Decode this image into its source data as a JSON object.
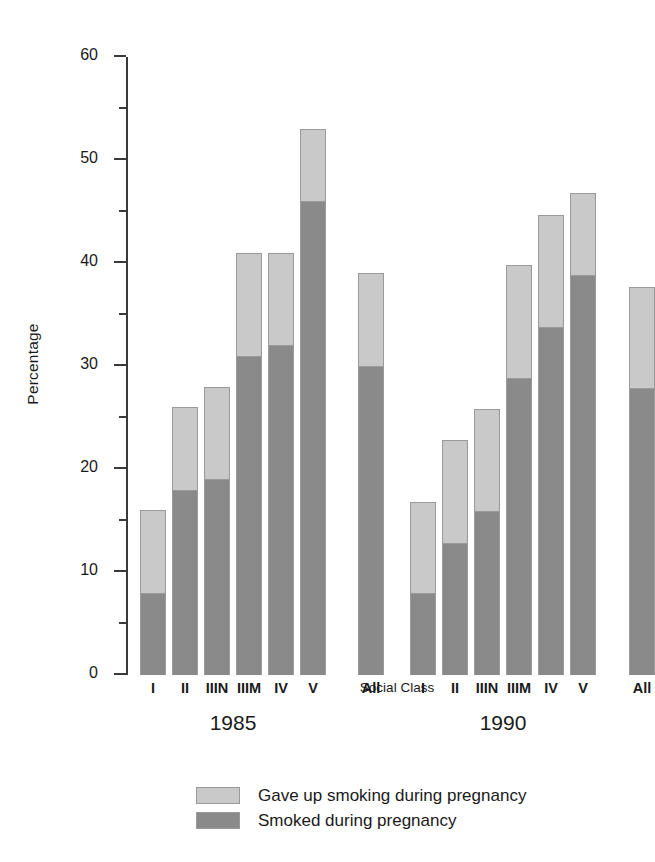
{
  "chart_data": {
    "type": "bar",
    "stacked": true,
    "title": "",
    "xlabel": "Social Class",
    "ylabel": "Percentage",
    "ylim": [
      0,
      60
    ],
    "ytick_major": [
      0,
      10,
      20,
      30,
      40,
      50,
      60
    ],
    "ytick_minor": [
      5,
      15,
      25,
      35,
      45,
      55
    ],
    "grid": false,
    "legend_position": "bottom-left",
    "categories": [
      "I",
      "II",
      "IIIN",
      "IIIM",
      "IV",
      "V",
      "All"
    ],
    "groups": [
      "1985",
      "1990"
    ],
    "series": [
      {
        "name": "Smoked during pregnancy",
        "color": "#8a8a8a",
        "values_1985": [
          8.0,
          18.0,
          19.0,
          31.0,
          32.0,
          46.0,
          30.0
        ],
        "values_1990": [
          8.0,
          12.8,
          15.9,
          28.8,
          33.8,
          38.8,
          27.9
        ]
      },
      {
        "name": "Gave up smoking during pregnancy",
        "color": "#c9c9c9",
        "values_1985": [
          8.0,
          8.0,
          9.0,
          10.0,
          9.0,
          7.0,
          9.0
        ],
        "values_1990": [
          8.8,
          10.0,
          9.9,
          11.0,
          10.9,
          8.0,
          9.8
        ]
      }
    ],
    "totals_1985": [
      16.0,
      26.0,
      28.0,
      41.0,
      41.0,
      53.0,
      39.0
    ],
    "totals_1990": [
      16.8,
      22.8,
      25.8,
      39.8,
      44.7,
      46.8,
      37.7
    ]
  },
  "axis": {
    "y_title": "Percentage",
    "x_title": "Social Class",
    "y_ticks": [
      "0",
      "10",
      "20",
      "30",
      "40",
      "50",
      "60"
    ]
  },
  "groups": [
    {
      "label": "1985"
    },
    {
      "label": "1990"
    }
  ],
  "legend": {
    "items": [
      {
        "label": "Gave up smoking during pregnancy",
        "color": "#c9c9c9"
      },
      {
        "label": "Smoked during pregnancy",
        "color": "#8a8a8a"
      }
    ]
  },
  "colors": {
    "gave_up": "#c9c9c9",
    "smoked": "#8a8a8a",
    "axis": "#3a3a3a",
    "bar_outline": "#9a9a9a",
    "background": "#ffffff"
  }
}
